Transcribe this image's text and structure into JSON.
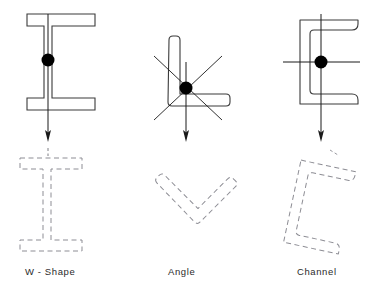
{
  "figure": {
    "type": "engineering-diagram",
    "background_color": "#ffffff",
    "solid_outline_color": "#3a3a3a",
    "dashed_outline_color": "#8d8d94",
    "axis_color": "#1a1a1a",
    "centroid_color": "#000000",
    "panels": [
      {
        "id": "w-shape",
        "label": "W - Shape",
        "label_x": 25,
        "label_y": 266,
        "solid": {
          "kind": "wide-flange-I",
          "center_x": 48,
          "top_flange": {
            "x": 27,
            "y": 14,
            "width": 68,
            "height": 12
          },
          "bottom_flange": {
            "x": 27,
            "y": 98,
            "width": 68,
            "height": 12
          },
          "web": {
            "x": 44,
            "y": 26,
            "width": 8,
            "height": 72
          }
        },
        "centroid": {
          "x": 48,
          "y": 60,
          "radius": 6.5
        },
        "axes": [
          {
            "name": "vertical-axis-arrow",
            "x1": 48,
            "y1": 14,
            "x2": 48,
            "y2": 141,
            "arrow": true
          }
        ],
        "dashed": {
          "kind": "wide-flange-I",
          "center_x": 48,
          "rotation_deg": 0,
          "top_flange": {
            "x": 20,
            "y": 158,
            "width": 62,
            "height": 11
          },
          "bottom_flange": {
            "x": 20,
            "y": 240,
            "width": 62,
            "height": 11
          },
          "web": {
            "x": 43,
            "y": 169,
            "width": 8,
            "height": 71
          }
        }
      },
      {
        "id": "angle",
        "label": "Angle",
        "label_x": 168,
        "label_y": 266,
        "solid": {
          "kind": "L-angle",
          "vertical_leg": {
            "x": 168,
            "y": 36,
            "width": 12,
            "height": 70
          },
          "horizontal_leg": {
            "x": 168,
            "y": 94,
            "width": 62,
            "height": 12
          }
        },
        "centroid": {
          "x": 186,
          "y": 88,
          "radius": 6.5
        },
        "axes": [
          {
            "name": "vertical-axis-arrow",
            "x1": 186,
            "y1": 62,
            "x2": 186,
            "y2": 141,
            "arrow": true
          },
          {
            "name": "principal-axis-major",
            "x1": 154,
            "y1": 56,
            "x2": 222,
            "y2": 120,
            "arrow": false
          },
          {
            "name": "principal-axis-minor",
            "x1": 154,
            "y1": 120,
            "x2": 222,
            "y2": 56,
            "arrow": false
          }
        ],
        "dashed": {
          "kind": "L-angle",
          "rotation_deg": -45,
          "pivot_x": 186,
          "pivot_y": 205,
          "vertical_leg": {
            "x": 180,
            "y": 165,
            "width": 11,
            "height": 62
          },
          "horizontal_leg": {
            "x": 180,
            "y": 216,
            "width": 56,
            "height": 11
          }
        }
      },
      {
        "id": "channel",
        "label": "Channel",
        "label_x": 297,
        "label_y": 266,
        "solid": {
          "kind": "C-channel",
          "web": {
            "x": 300,
            "y": 20,
            "width": 10,
            "height": 84
          },
          "top_flange": {
            "x": 310,
            "y": 20,
            "width": 48,
            "height": 10
          },
          "bottom_flange": {
            "x": 310,
            "y": 94,
            "width": 48,
            "height": 10
          }
        },
        "centroid": {
          "x": 321,
          "y": 62,
          "radius": 6.5
        },
        "axes": [
          {
            "name": "vertical-axis-arrow",
            "x1": 321,
            "y1": 14,
            "x2": 321,
            "y2": 141,
            "arrow": true
          },
          {
            "name": "horizontal-axis",
            "x1": 283,
            "y1": 62,
            "x2": 360,
            "y2": 62,
            "arrow": false
          }
        ],
        "dashed": {
          "kind": "C-channel",
          "rotation_deg": 12,
          "pivot_x": 315,
          "pivot_y": 205,
          "web": {
            "x": 292,
            "y": 164,
            "width": 10,
            "height": 84
          },
          "top_flange": {
            "x": 302,
            "y": 164,
            "width": 46,
            "height": 10
          },
          "bottom_flange": {
            "x": 302,
            "y": 238,
            "width": 46,
            "height": 10
          }
        }
      }
    ]
  }
}
